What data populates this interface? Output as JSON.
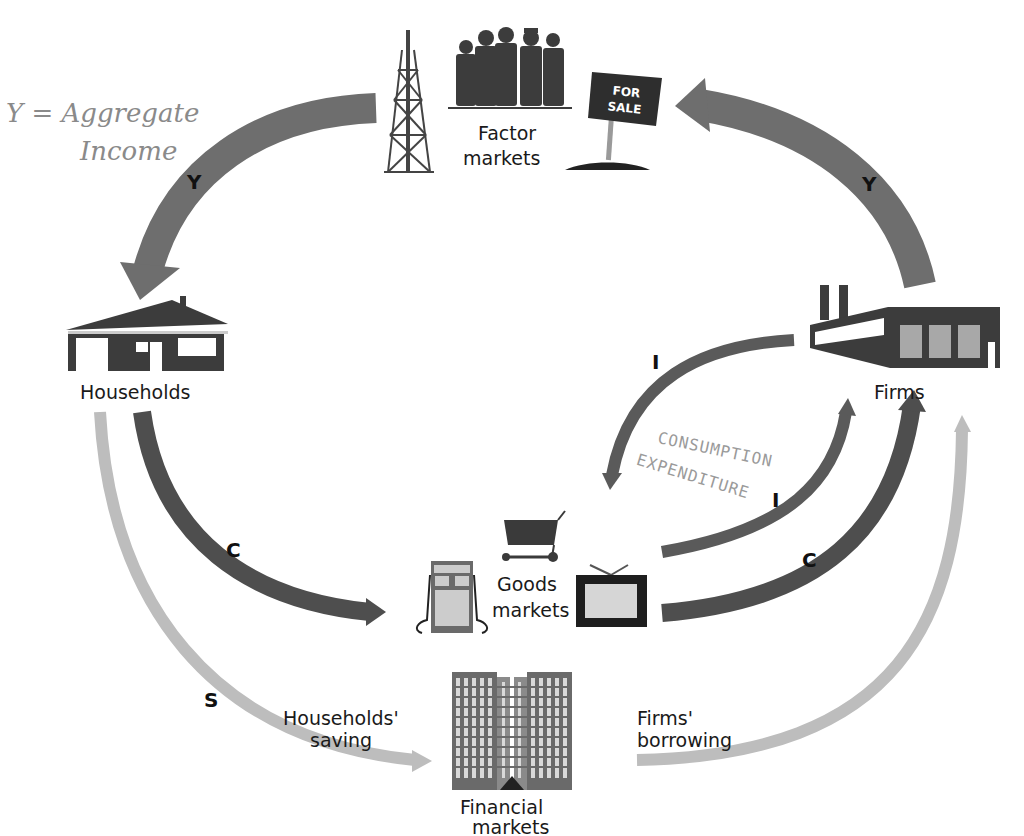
{
  "annotations": {
    "income_line1": "Y = Aggregate",
    "income_line2": "Income",
    "consumption_line1": "CONSUMPTION",
    "consumption_line2": "EXPENDITURE"
  },
  "nodes": {
    "factor_markets": {
      "line1": "Factor",
      "line2": "markets",
      "sign_line1": "FOR",
      "sign_line2": "SALE"
    },
    "households": {
      "label": "Households"
    },
    "firms": {
      "label": "Firms"
    },
    "goods_markets": {
      "line1": "Goods",
      "line2": "markets"
    },
    "financial_markets": {
      "line1": "Financial",
      "line2": "markets"
    }
  },
  "flows": {
    "y_left": "Y",
    "y_right": "Y",
    "c_left": "C",
    "c_right": "C",
    "i_top": "I",
    "i_mid": "I",
    "s": "S",
    "households_saving_line1": "Households'",
    "households_saving_line2": "saving",
    "firms_borrowing_line1": "Firms'",
    "firms_borrowing_line2": "borrowing"
  },
  "colors": {
    "income_arrow": "#6e6e6e",
    "spending_arrow": "#4e4e4e",
    "saving_arrow": "#bdbdbd",
    "icon_dark": "#3a3a3a",
    "icon_light": "#bfbfbf"
  }
}
